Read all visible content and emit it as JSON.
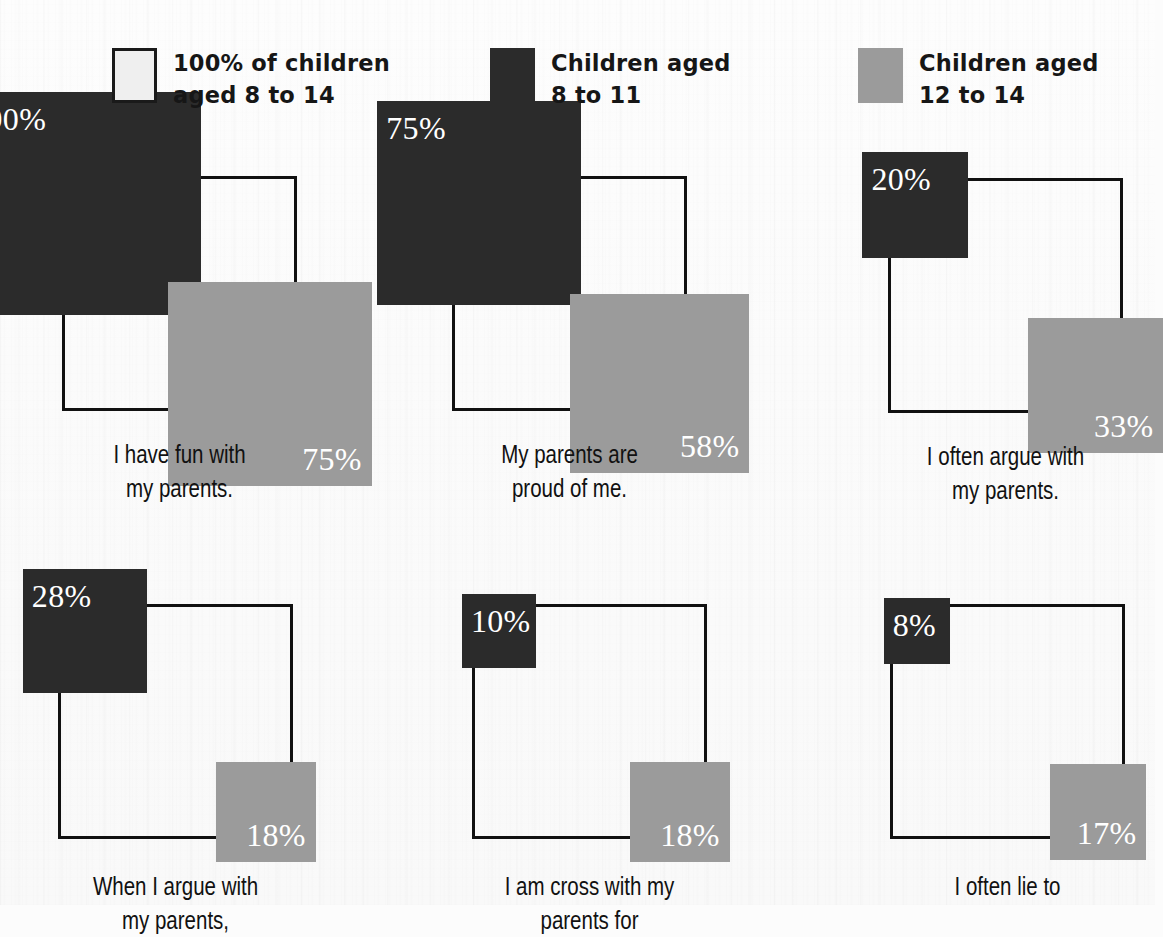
{
  "title_partial": "",
  "colors": {
    "dark": "#2b2b2b",
    "gray": "#9b9b9b",
    "outline": "#111111",
    "background": "#fcfcfc",
    "label_text": "#ffffff"
  },
  "legend": {
    "items": [
      {
        "swatch": "outline-square-swatch",
        "label": "100% of children\naged 8 to 14"
      },
      {
        "swatch": "dark-square-swatch",
        "label": "Children aged\n8 to 11"
      },
      {
        "swatch": "gray-square-swatch",
        "label": "Children aged\n12 to 14"
      }
    ]
  },
  "chart_data": {
    "type": "bar",
    "title": "",
    "xlabel": "",
    "ylabel": "",
    "reference_value": 100,
    "reference_label": "100% of children aged 8 to 14",
    "encoding": "nested area-proportional squares; square side proportional to sqrt(percent)",
    "categories": [
      "I have fun with my parents.",
      "My parents are proud of me.",
      "I often argue with my parents.",
      "When I argue with my parents,",
      "I am cross with my parents for",
      "I often lie to"
    ],
    "series": [
      {
        "name": "Children aged 8 to 11",
        "values": [
          90,
          75,
          20,
          28,
          10,
          8
        ]
      },
      {
        "name": "Children aged 12 to 14",
        "values": [
          75,
          58,
          33,
          18,
          18,
          17
        ]
      }
    ],
    "legend_position": "top"
  },
  "cells": [
    {
      "caption": "I have fun with\nmy parents.",
      "dark_label": "90%",
      "dark_value": 90,
      "gray_label": "75%",
      "gray_value": 75
    },
    {
      "caption": "My parents are\nproud of me.",
      "dark_label": "75%",
      "dark_value": 75,
      "gray_label": "58%",
      "gray_value": 58
    },
    {
      "caption": "I often argue with\nmy parents.",
      "dark_label": "20%",
      "dark_value": 20,
      "gray_label": "33%",
      "gray_value": 33
    },
    {
      "caption": "When I argue with my parents,",
      "dark_label": "28%",
      "dark_value": 28,
      "gray_label": "18%",
      "gray_value": 18
    },
    {
      "caption": "I am cross with my parents for",
      "dark_label": "10%",
      "dark_value": 10,
      "gray_label": "18%",
      "gray_value": 18
    },
    {
      "caption": "I often lie to",
      "dark_label": "8%",
      "dark_value": 8,
      "gray_label": "17%",
      "gray_value": 17
    }
  ]
}
